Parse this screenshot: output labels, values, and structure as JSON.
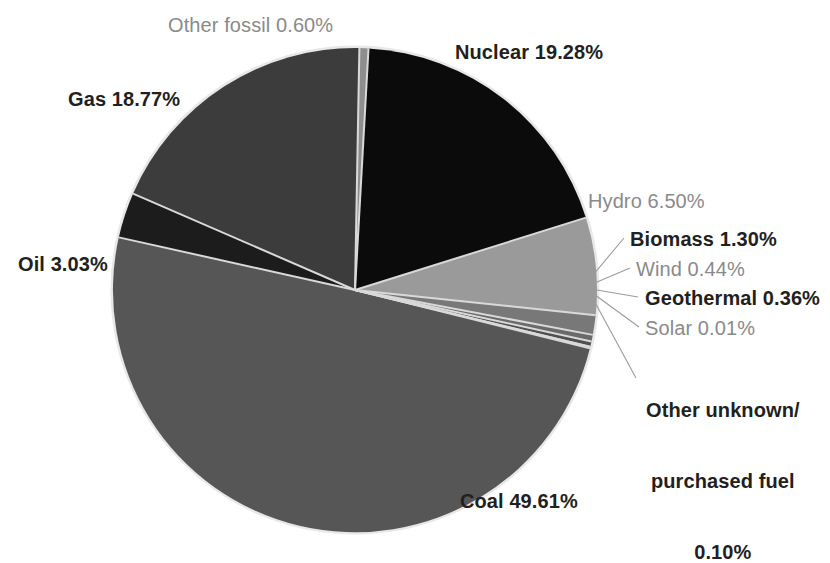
{
  "chart_data": {
    "type": "pie",
    "title": "",
    "unit": "percent",
    "categories": [
      "Coal",
      "Nuclear",
      "Gas",
      "Hydro",
      "Oil",
      "Biomass",
      "Other fossil",
      "Wind",
      "Geothermal",
      "Other unknown/purchased fuel",
      "Solar"
    ],
    "values": [
      49.61,
      19.28,
      18.77,
      6.5,
      3.03,
      1.3,
      0.6,
      0.44,
      0.36,
      0.1,
      0.01
    ],
    "legend_position": "callout-labels",
    "grid": false,
    "slices": [
      {
        "name": "Coal",
        "label": "Coal 49.61%",
        "value": 49.61,
        "color": "#565656",
        "text_color": "#231f20",
        "text_weight": "bold"
      },
      {
        "name": "Nuclear",
        "label": "Nuclear 19.28%",
        "value": 19.28,
        "color": "#0b0b0b",
        "text_color": "#231f20",
        "text_weight": "bold"
      },
      {
        "name": "Gas",
        "label": "Gas 18.77%",
        "value": 18.77,
        "color": "#3c3c3c",
        "text_color": "#231f20",
        "text_weight": "bold"
      },
      {
        "name": "Hydro",
        "label": "Hydro 6.50%",
        "value": 6.5,
        "color": "#9a9a9a",
        "text_color": "#8a8a8a",
        "text_weight": "normal"
      },
      {
        "name": "Oil",
        "label": "Oil 3.03%",
        "value": 3.03,
        "color": "#1c1c1c",
        "text_color": "#231f20",
        "text_weight": "bold"
      },
      {
        "name": "Biomass",
        "label": "Biomass 1.30%",
        "value": 1.3,
        "color": "#787878",
        "text_color": "#231f20",
        "text_weight": "bold"
      },
      {
        "name": "Other fossil",
        "label": "Other fossil 0.60%",
        "value": 0.6,
        "color": "#8e8e8e",
        "text_color": "#8a8a8a",
        "text_weight": "normal"
      },
      {
        "name": "Wind",
        "label": "Wind 0.44%",
        "value": 0.44,
        "color": "#6a6a6a",
        "text_color": "#8a8a8a",
        "text_weight": "normal"
      },
      {
        "name": "Geothermal",
        "label": "Geothermal 0.36%",
        "value": 0.36,
        "color": "#505050",
        "text_color": "#231f20",
        "text_weight": "bold"
      },
      {
        "name": "Solar",
        "label": "Solar 0.01%",
        "value": 0.01,
        "color": "#707070",
        "text_color": "#8a8a8a",
        "text_weight": "normal"
      },
      {
        "name": "OtherUnknown",
        "label": "Other unknown/\npurchased fuel\n0.10%",
        "value": 0.1,
        "color": "#606060",
        "text_color": "#231f20",
        "text_weight": "bold"
      }
    ]
  },
  "labels": {
    "other_fossil": "Other fossil 0.60%",
    "nuclear": "Nuclear 19.28%",
    "gas": "Gas 18.77%",
    "hydro": "Hydro 6.50%",
    "biomass": "Biomass 1.30%",
    "wind": "Wind 0.44%",
    "geothermal": "Geothermal 0.36%",
    "solar": "Solar 0.01%",
    "oil": "Oil 3.03%",
    "coal": "Coal 49.61%",
    "other_unknown_line1": "Other unknown/",
    "other_unknown_line2": "purchased fuel",
    "other_unknown_line3": "0.10%"
  },
  "colors": {
    "background": "#ffffff",
    "coal": "#565656",
    "nuclear": "#0b0b0b",
    "gas": "#3c3c3c",
    "hydro": "#9a9a9a",
    "oil": "#1c1c1c",
    "biomass": "#787878",
    "other_fossil": "#8e8e8e",
    "wind": "#6a6a6a",
    "geothermal": "#505050",
    "solar": "#707070",
    "other_unknown": "#606060",
    "separator": "#d9d9d9",
    "leader_line": "#9b9b9b",
    "text_dark": "#231f20",
    "text_light": "#8a8a8a"
  },
  "geometry": {
    "center_x": 355,
    "center_y": 290,
    "radius": 242
  }
}
